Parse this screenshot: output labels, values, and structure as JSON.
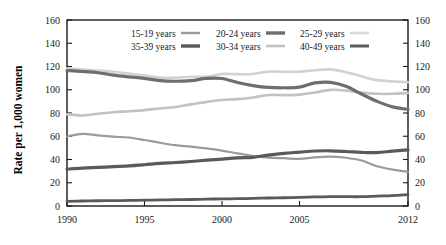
{
  "chart_data": {
    "type": "line",
    "title": "",
    "xlabel": "",
    "ylabel": "Rate per 1,000 women",
    "xlim": [
      1990,
      2012
    ],
    "ylim": [
      0,
      160
    ],
    "xticks": [
      "1990",
      "1995",
      "2000",
      "2005",
      "2012"
    ],
    "xtick_values": [
      1990,
      1995,
      2000,
      2005,
      2012
    ],
    "yticks": [
      "0",
      "20",
      "40",
      "60",
      "80",
      "100",
      "120",
      "140",
      "160"
    ],
    "ytick_values": [
      0,
      20,
      40,
      60,
      80,
      100,
      120,
      140,
      160
    ],
    "grid": false,
    "legend_position": "top-center",
    "right_axis_mirrored": true,
    "x": [
      1990,
      1991,
      1992,
      1993,
      1994,
      1995,
      1996,
      1997,
      1998,
      1999,
      2000,
      2001,
      2002,
      2003,
      2004,
      2005,
      2006,
      2007,
      2008,
      2009,
      2010,
      2011,
      2012
    ],
    "series": [
      {
        "name": "15-19 years",
        "color": "#9a9a9a",
        "width": 2.2,
        "values": [
          59.9,
          62.1,
          60.7,
          59.6,
          58.9,
          56.8,
          54.4,
          52.3,
          51.1,
          49.6,
          47.7,
          45.3,
          43.0,
          41.6,
          41.1,
          40.5,
          41.9,
          42.5,
          41.5,
          39.1,
          34.2,
          31.3,
          29.4
        ]
      },
      {
        "name": "20-24 years",
        "color": "#6e6e6e",
        "width": 3.2,
        "values": [
          116.5,
          115.7,
          114.6,
          112.6,
          111.1,
          109.8,
          107.8,
          107.3,
          107.9,
          109.7,
          109.7,
          106.2,
          103.6,
          102.0,
          101.7,
          102.2,
          105.9,
          106.4,
          103.0,
          96.3,
          90.0,
          85.3,
          83.1
        ]
      },
      {
        "name": "25-29 years",
        "color": "#d2d2d2",
        "width": 2.6,
        "values": [
          118.2,
          117.4,
          116.5,
          115.5,
          113.9,
          112.2,
          110.4,
          110.4,
          111.2,
          111.2,
          113.5,
          113.4,
          113.6,
          115.6,
          115.5,
          115.5,
          116.8,
          117.5,
          115.1,
          111.5,
          108.3,
          107.2,
          106.5
        ]
      },
      {
        "name": "35-39 years",
        "color": "#5a5a5a",
        "width": 3.2,
        "values": [
          31.7,
          32.6,
          33.2,
          33.8,
          34.5,
          35.5,
          36.6,
          37.4,
          38.3,
          39.4,
          40.4,
          41.4,
          41.9,
          43.8,
          45.3,
          46.3,
          47.3,
          47.5,
          46.9,
          46.1,
          45.9,
          47.2,
          48.3
        ]
      },
      {
        "name": "30-34 years",
        "color": "#c2c2c2",
        "width": 2.6,
        "values": [
          78.8,
          77.9,
          79.4,
          80.6,
          81.5,
          82.5,
          83.9,
          85.2,
          87.4,
          89.6,
          91.2,
          91.9,
          93.3,
          95.5,
          95.4,
          95.8,
          97.7,
          99.9,
          99.3,
          97.5,
          96.5,
          96.5,
          97.3
        ]
      },
      {
        "name": "40-49 years",
        "color": "#5a5a5a",
        "width": 2.8,
        "values": [
          4.0,
          4.3,
          4.5,
          4.6,
          4.8,
          5.0,
          5.2,
          5.4,
          5.6,
          5.9,
          6.1,
          6.3,
          6.5,
          6.9,
          7.1,
          7.4,
          7.8,
          8.0,
          8.0,
          8.0,
          8.5,
          9.0,
          9.8
        ]
      }
    ],
    "legend": [
      {
        "label": "15-19 years",
        "color": "#9a9a9a",
        "width": 2.4
      },
      {
        "label": "20-24 years",
        "color": "#6e6e6e",
        "width": 3.4
      },
      {
        "label": "25-29 years",
        "color": "#d8d8d8",
        "width": 2.6
      },
      {
        "label": "35-39 years",
        "color": "#5a5a5a",
        "width": 3.4
      },
      {
        "label": "30-34 years",
        "color": "#c2c2c2",
        "width": 2.6
      },
      {
        "label": "40-49 years",
        "color": "#5a5a5a",
        "width": 3.0
      }
    ]
  }
}
